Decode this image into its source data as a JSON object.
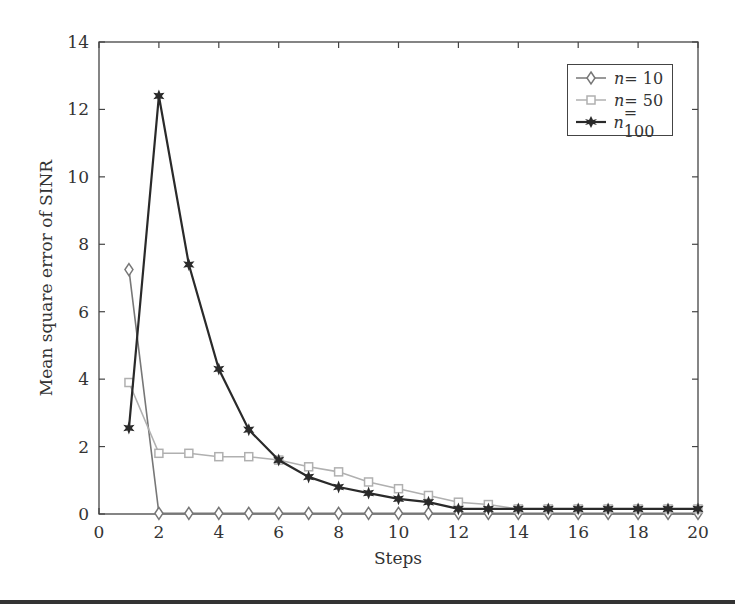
{
  "chart_data": {
    "type": "line",
    "title": "",
    "xlabel": "Steps",
    "ylabel": "Mean square error of SINR",
    "xlim": [
      0,
      20
    ],
    "ylim": [
      0,
      14
    ],
    "xticks": [
      0,
      2,
      4,
      6,
      8,
      10,
      12,
      14,
      16,
      18,
      20
    ],
    "yticks": [
      0,
      2,
      4,
      6,
      8,
      10,
      12,
      14
    ],
    "grid": false,
    "legend_position": "upper right",
    "x": [
      1,
      2,
      3,
      4,
      5,
      6,
      7,
      8,
      9,
      10,
      11,
      12,
      13,
      14,
      15,
      16,
      17,
      18,
      19,
      20
    ],
    "series": [
      {
        "name": "n = 10",
        "marker": "diamond",
        "color": "#777777",
        "values": [
          7.25,
          0.02,
          0.02,
          0.02,
          0.02,
          0.02,
          0.02,
          0.02,
          0.02,
          0.02,
          0.02,
          0.02,
          0.02,
          0.02,
          0.02,
          0.02,
          0.02,
          0.02,
          0.02,
          0.02
        ]
      },
      {
        "name": "n = 50",
        "marker": "square",
        "color": "#b0b0b0",
        "values": [
          3.9,
          1.8,
          1.8,
          1.7,
          1.7,
          1.6,
          1.4,
          1.25,
          0.95,
          0.75,
          0.55,
          0.35,
          0.28,
          0.15,
          0.15,
          0.15,
          0.15,
          0.15,
          0.15,
          0.15
        ]
      },
      {
        "name": "n = 100",
        "marker": "star",
        "color": "#2a2a2a",
        "values": [
          2.55,
          12.4,
          7.4,
          4.3,
          2.5,
          1.6,
          1.1,
          0.8,
          0.62,
          0.45,
          0.35,
          0.15,
          0.15,
          0.15,
          0.15,
          0.15,
          0.15,
          0.15,
          0.15,
          0.15
        ]
      }
    ]
  },
  "legend": {
    "items": [
      {
        "var": "n",
        "eq": " = 10"
      },
      {
        "var": "n",
        "eq": " = 50"
      },
      {
        "var": "n",
        "eq": " = 100"
      }
    ]
  }
}
